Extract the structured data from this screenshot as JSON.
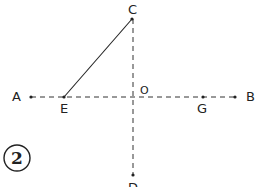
{
  "figure": {
    "number_label": "2",
    "points": {
      "A": {
        "label": "A",
        "x": 31,
        "y": 97
      },
      "E": {
        "label": "E",
        "x": 64,
        "y": 97
      },
      "O": {
        "label": "O",
        "x": 133,
        "y": 97
      },
      "G": {
        "label": "G",
        "x": 203,
        "y": 97
      },
      "B": {
        "label": "B",
        "x": 235,
        "y": 97
      },
      "C": {
        "label": "C",
        "x": 132,
        "y": 19
      },
      "D": {
        "label": "D",
        "x": 133,
        "y": 175
      }
    },
    "segments": [
      {
        "from": "A",
        "to": "B",
        "style": "dashed"
      },
      {
        "from": "C",
        "to": "D",
        "style": "dashed"
      },
      {
        "from": "E",
        "to": "C",
        "style": "solid"
      }
    ],
    "colors": {
      "ink": "#222222",
      "background": "#ffffff"
    }
  }
}
